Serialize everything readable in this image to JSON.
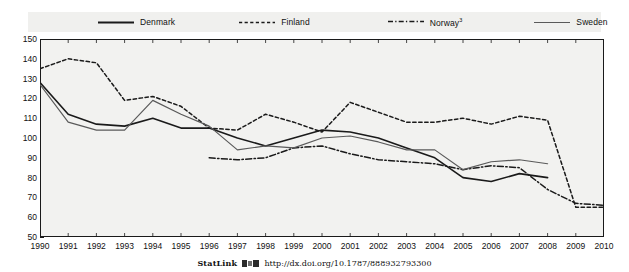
{
  "legend": {
    "entries": [
      {
        "label": "Denmark",
        "sup": "",
        "style": "solid",
        "color": "#1a1a1a"
      },
      {
        "label": "Finland",
        "sup": "",
        "style": "dashed",
        "color": "#1a1a1a"
      },
      {
        "label": "Norway",
        "sup": "3",
        "style": "dash-dot",
        "color": "#1a1a1a"
      },
      {
        "label": "Sweden",
        "sup": "",
        "style": "solid-thin",
        "color": "#5a5a5a"
      }
    ]
  },
  "footer": {
    "statlink_label": "StatLink",
    "statlink_icon": "statlink-barcode-icon",
    "url": "http://dx.doi.org/10.1787/888932793300"
  },
  "chart_data": {
    "type": "line",
    "title": "",
    "subtitle": "",
    "xlabel": "",
    "ylabel": "",
    "xlim": [
      1990,
      2010
    ],
    "ylim": [
      50,
      150
    ],
    "ytick_step": 10,
    "grid": false,
    "legend_position": "top",
    "xticks": [
      1990,
      1991,
      1992,
      1993,
      1994,
      1995,
      1996,
      1997,
      1998,
      1999,
      2000,
      2001,
      2002,
      2003,
      2004,
      2005,
      2006,
      2007,
      2008,
      2009,
      2010
    ],
    "yticks": [
      50,
      60,
      70,
      80,
      90,
      100,
      110,
      120,
      130,
      140,
      150
    ],
    "x": [
      1990,
      1991,
      1992,
      1993,
      1994,
      1995,
      1996,
      1997,
      1998,
      1999,
      2000,
      2001,
      2002,
      2003,
      2004,
      2005,
      2006,
      2007,
      2008,
      2009,
      2010
    ],
    "series": [
      {
        "name": "Denmark",
        "style": "solid",
        "color": "#1a1a1a",
        "width": 1.6,
        "values": [
          128,
          112,
          107,
          106,
          110,
          105,
          105,
          100,
          96,
          100,
          104,
          103,
          100,
          95,
          90,
          80,
          78,
          82,
          80,
          null,
          null
        ]
      },
      {
        "name": "Finland",
        "style": "dashed",
        "color": "#1a1a1a",
        "width": 1.5,
        "values": [
          135,
          140,
          138,
          119,
          121,
          116,
          105,
          104,
          112,
          108,
          103,
          118,
          113,
          108,
          108,
          110,
          107,
          111,
          109,
          65,
          65
        ]
      },
      {
        "name": "Norway",
        "style": "dash-dot",
        "color": "#1a1a1a",
        "width": 1.5,
        "values": [
          null,
          null,
          null,
          null,
          null,
          null,
          90,
          89,
          90,
          95,
          96,
          92,
          89,
          88,
          87,
          84,
          86,
          85,
          74,
          67,
          66
        ]
      },
      {
        "name": "Sweden",
        "style": "solid-thin",
        "color": "#5a5a5a",
        "width": 1.2,
        "values": [
          127,
          108,
          104,
          104,
          119,
          112,
          106,
          94,
          96,
          95,
          100,
          101,
          98,
          94,
          94,
          84,
          88,
          89,
          87,
          null,
          null
        ]
      }
    ]
  }
}
